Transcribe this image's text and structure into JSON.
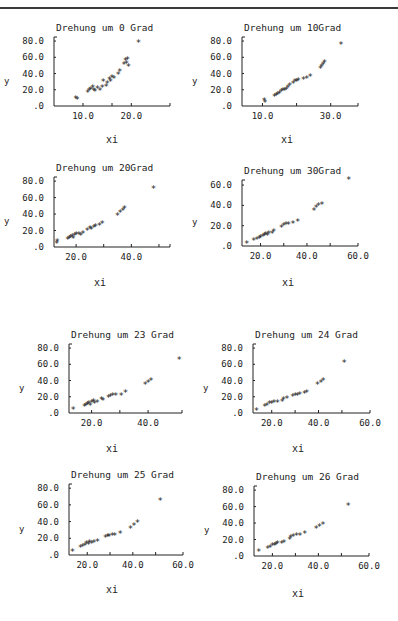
{
  "page": {
    "rule": true
  },
  "chart_data": [
    {
      "type": "scatter",
      "title": "Drehung um  0 Grad",
      "xlabel": "xi",
      "ylabel": "y",
      "box": {
        "x0": 54,
        "y0": 37,
        "x1": 170,
        "y1": 106
      },
      "xlim": [
        4,
        28
      ],
      "ylim": [
        0,
        85
      ],
      "xticks": [
        {
          "v": 10,
          "label": "10.0"
        },
        {
          "v": 16,
          "label": ""
        },
        {
          "v": 20,
          "label": "20.0"
        },
        {
          "v": 28,
          "label": ""
        }
      ],
      "yticks": [
        {
          "v": 0,
          "label": ".0"
        },
        {
          "v": 20,
          "label": "20.0"
        },
        {
          "v": 40,
          "label": "40.0"
        },
        {
          "v": 60,
          "label": "60.0"
        },
        {
          "v": 80,
          "label": "80.0"
        }
      ],
      "xlabel_pos": {
        "x": 112,
        "y": 143
      },
      "points": [
        [
          8.5,
          9
        ],
        [
          8.8,
          8
        ],
        [
          11,
          16
        ],
        [
          11.3,
          18
        ],
        [
          11.6,
          20
        ],
        [
          12,
          22
        ],
        [
          12.2,
          19
        ],
        [
          12.5,
          17
        ],
        [
          13,
          21
        ],
        [
          13.5,
          18
        ],
        [
          14,
          22
        ],
        [
          14.2,
          30
        ],
        [
          14.8,
          24
        ],
        [
          15,
          27
        ],
        [
          15.5,
          32
        ],
        [
          15.7,
          30
        ],
        [
          16,
          35
        ],
        [
          16.4,
          33
        ],
        [
          17.3,
          38
        ],
        [
          17.6,
          42
        ],
        [
          18.5,
          50
        ],
        [
          18.8,
          55
        ],
        [
          19,
          52
        ],
        [
          19.2,
          57
        ],
        [
          19.4,
          48
        ],
        [
          21.5,
          78
        ]
      ]
    },
    {
      "type": "scatter",
      "title": "Drehung um  10Grad",
      "xlabel": "xi",
      "ylabel": "y",
      "box": {
        "x0": 242,
        "y0": 37,
        "x1": 358,
        "y1": 106
      },
      "xlim": [
        4,
        38
      ],
      "ylim": [
        0,
        85
      ],
      "xticks": [
        {
          "v": 10,
          "label": "10.0"
        },
        {
          "v": 20,
          "label": ""
        },
        {
          "v": 30,
          "label": "30.0"
        },
        {
          "v": 38,
          "label": ""
        }
      ],
      "yticks": [
        {
          "v": 0,
          "label": ".0"
        },
        {
          "v": 20,
          "label": "20.0"
        },
        {
          "v": 40,
          "label": "40.0"
        },
        {
          "v": 60,
          "label": "60.0"
        },
        {
          "v": 80,
          "label": "80.0"
        }
      ],
      "xlabel_pos": {
        "x": 287,
        "y": 143
      },
      "points": [
        [
          10.5,
          6
        ],
        [
          10.7,
          4
        ],
        [
          13.5,
          11
        ],
        [
          14,
          12
        ],
        [
          14.5,
          14
        ],
        [
          15,
          15
        ],
        [
          15.5,
          17
        ],
        [
          16,
          19
        ],
        [
          16.5,
          18
        ],
        [
          17,
          20
        ],
        [
          17.5,
          22
        ],
        [
          18,
          25
        ],
        [
          19,
          27
        ],
        [
          19.5,
          30
        ],
        [
          20,
          29
        ],
        [
          20.5,
          31
        ],
        [
          22,
          32
        ],
        [
          23,
          33
        ],
        [
          24,
          36
        ],
        [
          27,
          45
        ],
        [
          27.4,
          48
        ],
        [
          27.8,
          51
        ],
        [
          28.2,
          53
        ],
        [
          33,
          75
        ]
      ]
    },
    {
      "type": "scatter",
      "title": "Drehung um  20Grad",
      "xlabel": "xi",
      "ylabel": "y",
      "box": {
        "x0": 54,
        "y0": 177,
        "x1": 170,
        "y1": 247
      },
      "xlim": [
        12,
        54
      ],
      "ylim": [
        0,
        85
      ],
      "xticks": [
        {
          "v": 20,
          "label": "20.0"
        },
        {
          "v": 30,
          "label": ""
        },
        {
          "v": 40,
          "label": "40.0"
        },
        {
          "v": 50,
          "label": ""
        },
        {
          "v": 54,
          "label": ""
        }
      ],
      "yticks": [
        {
          "v": 0,
          "label": ".0"
        },
        {
          "v": 20,
          "label": "20.0"
        },
        {
          "v": 40,
          "label": "40.0"
        },
        {
          "v": 60,
          "label": "60.0"
        },
        {
          "v": 80,
          "label": "80.0"
        }
      ],
      "xlabel_pos": {
        "x": 100,
        "y": 286
      },
      "points": [
        [
          13,
          4
        ],
        [
          13.2,
          6
        ],
        [
          17,
          8
        ],
        [
          17.5,
          10
        ],
        [
          18,
          11
        ],
        [
          18.6,
          12
        ],
        [
          19,
          10
        ],
        [
          19.5,
          13
        ],
        [
          20,
          14
        ],
        [
          21,
          15
        ],
        [
          21.7,
          13
        ],
        [
          22.5,
          16
        ],
        [
          24,
          20
        ],
        [
          25,
          22
        ],
        [
          25.5,
          21
        ],
        [
          26.5,
          23
        ],
        [
          27,
          24
        ],
        [
          28.5,
          26
        ],
        [
          29.5,
          28
        ],
        [
          35,
          38
        ],
        [
          36,
          41
        ],
        [
          37,
          44
        ],
        [
          37.5,
          46
        ],
        [
          48,
          70
        ]
      ]
    },
    {
      "type": "scatter",
      "title": "Drehung um  30Grad",
      "xlabel": "xi",
      "ylabel": "y",
      "box": {
        "x0": 242,
        "y0": 180,
        "x1": 358,
        "y1": 246
      },
      "xlim": [
        12,
        62
      ],
      "ylim": [
        0,
        65
      ],
      "xticks": [
        {
          "v": 20,
          "label": "20.0"
        },
        {
          "v": 30,
          "label": ""
        },
        {
          "v": 40,
          "label": "40.0"
        },
        {
          "v": 50,
          "label": ""
        },
        {
          "v": 62,
          "label": "60.0"
        }
      ],
      "yticks": [
        {
          "v": 0,
          "label": ".0"
        },
        {
          "v": 20,
          "label": "20.0"
        },
        {
          "v": 40,
          "label": "40.0"
        },
        {
          "v": 60,
          "label": "60.0"
        }
      ],
      "xlabel_pos": {
        "x": 288,
        "y": 286
      },
      "points": [
        [
          14,
          2
        ],
        [
          17,
          5
        ],
        [
          18.5,
          6
        ],
        [
          19.5,
          7
        ],
        [
          20,
          8
        ],
        [
          21,
          9
        ],
        [
          21.7,
          10
        ],
        [
          22.2,
          11
        ],
        [
          23,
          10
        ],
        [
          23.5,
          12
        ],
        [
          25,
          12
        ],
        [
          25.7,
          14
        ],
        [
          29,
          18
        ],
        [
          30,
          20
        ],
        [
          31,
          21
        ],
        [
          32,
          21
        ],
        [
          34,
          22
        ],
        [
          36,
          24
        ],
        [
          43,
          34
        ],
        [
          44,
          37
        ],
        [
          45,
          39
        ],
        [
          46.5,
          40
        ],
        [
          58,
          65
        ]
      ]
    },
    {
      "type": "scatter",
      "title": "Drehung um 23 Grad",
      "xlabel": "xi",
      "ylabel": "y",
      "box": {
        "x0": 69,
        "y0": 344,
        "x1": 182,
        "y1": 413
      },
      "xlim": [
        12,
        52
      ],
      "ylim": [
        0,
        85
      ],
      "xticks": [
        {
          "v": 20,
          "label": "20.0"
        },
        {
          "v": 30,
          "label": ""
        },
        {
          "v": 40,
          "label": "40.0"
        },
        {
          "v": 52,
          "label": ""
        }
      ],
      "yticks": [
        {
          "v": 0,
          "label": ".0"
        },
        {
          "v": 20,
          "label": "20.0"
        },
        {
          "v": 40,
          "label": "40.0"
        },
        {
          "v": 60,
          "label": "60.0"
        },
        {
          "v": 80,
          "label": "80.0"
        }
      ],
      "xlabel_pos": {
        "x": 112,
        "y": 452
      },
      "points": [
        [
          13.5,
          4
        ],
        [
          17.5,
          8
        ],
        [
          18,
          9
        ],
        [
          18.5,
          10
        ],
        [
          19,
          11
        ],
        [
          19.5,
          9
        ],
        [
          20,
          12
        ],
        [
          20.7,
          13
        ],
        [
          21,
          11
        ],
        [
          22,
          12
        ],
        [
          23.5,
          16
        ],
        [
          24,
          15
        ],
        [
          26,
          18
        ],
        [
          26.7,
          20
        ],
        [
          27.5,
          21
        ],
        [
          28.5,
          21
        ],
        [
          30.5,
          21
        ],
        [
          32,
          25
        ],
        [
          39,
          34
        ],
        [
          40,
          37
        ],
        [
          41,
          39
        ],
        [
          51,
          65
        ]
      ]
    },
    {
      "type": "scatter",
      "title": "Drehung um 24 Grad",
      "xlabel": "xi",
      "ylabel": "y",
      "box": {
        "x0": 253,
        "y0": 344,
        "x1": 370,
        "y1": 413
      },
      "xlim": [
        12,
        62
      ],
      "ylim": [
        0,
        85
      ],
      "xticks": [
        {
          "v": 20,
          "label": "20.0"
        },
        {
          "v": 30,
          "label": ""
        },
        {
          "v": 40,
          "label": "40.0"
        },
        {
          "v": 50,
          "label": ""
        },
        {
          "v": 62,
          "label": "60.0"
        }
      ],
      "yticks": [
        {
          "v": 0,
          "label": ".0"
        },
        {
          "v": 20,
          "label": "20.0"
        },
        {
          "v": 40,
          "label": "40.0"
        },
        {
          "v": 60,
          "label": "60.0"
        },
        {
          "v": 80,
          "label": "80.0"
        }
      ],
      "xlabel_pos": {
        "x": 298,
        "y": 452
      },
      "points": [
        [
          13.5,
          3
        ],
        [
          17,
          8
        ],
        [
          18,
          9
        ],
        [
          19,
          11
        ],
        [
          20,
          11
        ],
        [
          21,
          12
        ],
        [
          22.5,
          12
        ],
        [
          24.5,
          13
        ],
        [
          25,
          16
        ],
        [
          26.5,
          17
        ],
        [
          29,
          20
        ],
        [
          30,
          21
        ],
        [
          31,
          21
        ],
        [
          32,
          22
        ],
        [
          34,
          23
        ],
        [
          35,
          25
        ],
        [
          39.5,
          34
        ],
        [
          41,
          37
        ],
        [
          42,
          40
        ],
        [
          51,
          62
        ]
      ]
    },
    {
      "type": "scatter",
      "title": "Drehung um 25 Grad",
      "xlabel": "xi",
      "ylabel": "y",
      "box": {
        "x0": 69,
        "y0": 484,
        "x1": 183,
        "y1": 555
      },
      "xlim": [
        12,
        62
      ],
      "ylim": [
        0,
        85
      ],
      "xticks": [
        {
          "v": 20,
          "label": "20.0"
        },
        {
          "v": 30,
          "label": ""
        },
        {
          "v": 40,
          "label": "40.0"
        },
        {
          "v": 50,
          "label": ""
        },
        {
          "v": 62,
          "label": "60.0"
        }
      ],
      "yticks": [
        {
          "v": 0,
          "label": ".0"
        },
        {
          "v": 20,
          "label": "20.0"
        },
        {
          "v": 40,
          "label": "40.0"
        },
        {
          "v": 60,
          "label": "60.0"
        },
        {
          "v": 80,
          "label": "80.0"
        }
      ],
      "xlabel_pos": {
        "x": 112,
        "y": 593
      },
      "points": [
        [
          13.5,
          4
        ],
        [
          17,
          8
        ],
        [
          18,
          10
        ],
        [
          19,
          11
        ],
        [
          19.7,
          13
        ],
        [
          20.5,
          12
        ],
        [
          21,
          14
        ],
        [
          22,
          13
        ],
        [
          23,
          14
        ],
        [
          24.5,
          16
        ],
        [
          28,
          20
        ],
        [
          29,
          22
        ],
        [
          29.5,
          21
        ],
        [
          31,
          23
        ],
        [
          32,
          23
        ],
        [
          34.5,
          25
        ],
        [
          39,
          31
        ],
        [
          40.5,
          35
        ],
        [
          42,
          38
        ],
        [
          52,
          65
        ]
      ]
    },
    {
      "type": "scatter",
      "title": "Drehung um 26 Grad",
      "xlabel": "xi",
      "ylabel": "y",
      "box": {
        "x0": 254,
        "y0": 486,
        "x1": 369,
        "y1": 556
      },
      "xlim": [
        12,
        62
      ],
      "ylim": [
        0,
        85
      ],
      "xticks": [
        {
          "v": 20,
          "label": "20.0"
        },
        {
          "v": 30,
          "label": ""
        },
        {
          "v": 40,
          "label": "40.0"
        },
        {
          "v": 50,
          "label": ""
        },
        {
          "v": 62,
          "label": "60.0"
        }
      ],
      "yticks": [
        {
          "v": 0,
          "label": ".0"
        },
        {
          "v": 20,
          "label": "20.0"
        },
        {
          "v": 40,
          "label": "40.0"
        },
        {
          "v": 60,
          "label": "60.0"
        },
        {
          "v": 80,
          "label": "80.0"
        }
      ],
      "xlabel_pos": {
        "x": 298,
        "y": 597
      },
      "points": [
        [
          14,
          5
        ],
        [
          18,
          9
        ],
        [
          19,
          10
        ],
        [
          20,
          12
        ],
        [
          21,
          12
        ],
        [
          21.5,
          13
        ],
        [
          22.2,
          14
        ],
        [
          24,
          15
        ],
        [
          25,
          16
        ],
        [
          27.5,
          20
        ],
        [
          28,
          22
        ],
        [
          29,
          23
        ],
        [
          30.5,
          24
        ],
        [
          32,
          24
        ],
        [
          34,
          27
        ],
        [
          39,
          33
        ],
        [
          40.5,
          35
        ],
        [
          42,
          38
        ],
        [
          53,
          61
        ]
      ]
    }
  ]
}
